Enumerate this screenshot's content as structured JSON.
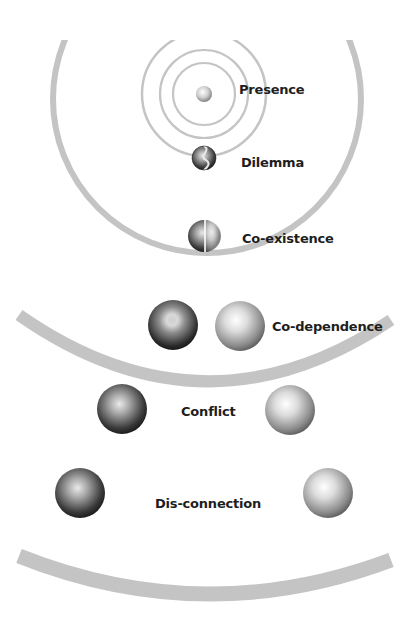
{
  "diagram": {
    "colors": {
      "background": "#ffffff",
      "ring": "#bdbdbd",
      "arc": "#c4c4c4",
      "text": "#1e1e1e",
      "sphere_dark": "#1a1a1a",
      "sphere_light": "#f2f2f2"
    },
    "levels": [
      {
        "id": "presence",
        "label": "Presence"
      },
      {
        "id": "dilemma",
        "label": "Dilemma"
      },
      {
        "id": "co-existence",
        "label": "Co-existence"
      },
      {
        "id": "co-dependence",
        "label": "Co-dependence"
      },
      {
        "id": "conflict",
        "label": "Conflict"
      },
      {
        "id": "dis-connection",
        "label": "Dis-connection"
      }
    ]
  }
}
